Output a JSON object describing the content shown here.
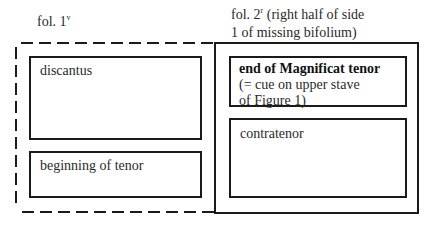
{
  "diagram": {
    "left_folio": {
      "caption_main": "fol. 1",
      "caption_sup": "v",
      "outline_style": "dashed",
      "boxes": [
        {
          "label": "discantus"
        },
        {
          "label": "beginning of tenor"
        }
      ]
    },
    "right_folio": {
      "caption_main": "fol. 2",
      "caption_sup": "r",
      "caption_rest_line1": " (right half of side",
      "caption_line2": "1 of missing bifolium)",
      "outline_style": "solid",
      "boxes": [
        {
          "label_bold": "end of Magnificat tenor",
          "label_line2": "(= cue on upper stave",
          "label_line3": "of Figure 1)"
        },
        {
          "label": "contratenor"
        }
      ]
    },
    "colors": {
      "stroke": "#1a1a1a",
      "text": "#2a2a2a",
      "background": "#ffffff"
    }
  }
}
